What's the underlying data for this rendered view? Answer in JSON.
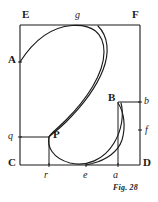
{
  "figure": {
    "caption": "Fig. 28",
    "stroke_color": "#1a1a1a",
    "background_color": "#ffffff",
    "frame": {
      "corner_labels": {
        "top_left": "E",
        "top_right": "F",
        "bottom_left": "C",
        "bottom_right": "D"
      }
    },
    "point_labels": {
      "curve_start_left": "A",
      "upper_tangent_top": "g",
      "inflection_point": "P",
      "upper_right_corner_point": "B",
      "right_edge_upper": "b",
      "right_edge_lower": "f",
      "left_edge_lower": "q",
      "bottom_left_tick": "r",
      "bottom_middle_tick": "e",
      "bottom_right_tick": "a"
    },
    "labels": [
      {
        "id": "E",
        "text": "E",
        "style": "cap",
        "x": 22,
        "y": 9
      },
      {
        "id": "F",
        "text": "F",
        "style": "cap",
        "x": 132,
        "y": 9
      },
      {
        "id": "g",
        "text": "g",
        "style": "ital",
        "x": 75,
        "y": 10
      },
      {
        "id": "A",
        "text": "A",
        "style": "cap",
        "x": 8,
        "y": 54
      },
      {
        "id": "B",
        "text": "B",
        "style": "cap",
        "x": 108,
        "y": 92
      },
      {
        "id": "b",
        "text": "b",
        "style": "ital",
        "x": 144,
        "y": 96
      },
      {
        "id": "f",
        "text": "f",
        "style": "ital",
        "x": 145,
        "y": 125
      },
      {
        "id": "q",
        "text": "q",
        "style": "ital",
        "x": 8,
        "y": 131
      },
      {
        "id": "P",
        "text": "P",
        "style": "cap",
        "x": 53,
        "y": 129
      },
      {
        "id": "C",
        "text": "C",
        "style": "cap",
        "x": 8,
        "y": 157
      },
      {
        "id": "D",
        "text": "D",
        "style": "cap",
        "x": 143,
        "y": 157
      },
      {
        "id": "r",
        "text": "r",
        "style": "ital",
        "x": 44,
        "y": 170
      },
      {
        "id": "e",
        "text": "e",
        "style": "ital",
        "x": 83,
        "y": 170
      },
      {
        "id": "a",
        "text": "a",
        "style": "ital",
        "x": 113,
        "y": 170
      }
    ]
  },
  "geometry": {
    "frame_rect": {
      "left": 20,
      "top": 25,
      "right": 140,
      "bottom": 165
    },
    "curve_description": "S-shaped curve from A on left edge, up to tangent at g on top edge, down through inflection P, dipping to minimum near e on bottom edge, rising to b on right edge",
    "auxiliary_rect_left": {
      "from": "q",
      "through": "P",
      "to": "r"
    },
    "auxiliary_rect_right": {
      "from": "B",
      "through": "b",
      "to": "a"
    }
  }
}
